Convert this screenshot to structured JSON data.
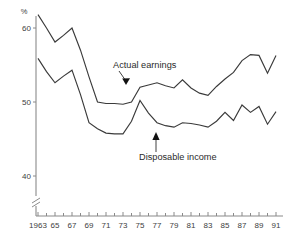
{
  "chart_data": {
    "type": "line",
    "title": "",
    "subtitle": "",
    "xlabel": "",
    "ylabel": "%",
    "unit_label": "%",
    "grid": false,
    "legend_position": "inline-annotations",
    "xlim": [
      1962.5,
      1991.5
    ],
    "ylim": [
      36.5,
      62.5
    ],
    "y_axis_break": true,
    "y_ticks": [
      60,
      50,
      40
    ],
    "y_tick_labels": [
      "60",
      "50",
      "40"
    ],
    "x_ticks": [
      1963,
      1965,
      1967,
      1969,
      1971,
      1973,
      1975,
      1977,
      1979,
      1981,
      1983,
      1985,
      1987,
      1989,
      1991
    ],
    "x_tick_labels": [
      "1963",
      "65",
      "67",
      "69",
      "71",
      "73",
      "75",
      "77",
      "79",
      "81",
      "83",
      "85",
      "87",
      "89",
      "91"
    ],
    "x": [
      1963,
      1964,
      1965,
      1966,
      1967,
      1968,
      1969,
      1970,
      1971,
      1972,
      1973,
      1974,
      1975,
      1976,
      1977,
      1978,
      1979,
      1980,
      1981,
      1982,
      1983,
      1984,
      1985,
      1986,
      1987,
      1988,
      1989,
      1990,
      1991
    ],
    "series": [
      {
        "name": "Actual earnings",
        "color": "#3a3a3a",
        "values": [
          61.8,
          60.0,
          58.1,
          59.0,
          60.0,
          57.0,
          53.4,
          50.0,
          49.8,
          49.8,
          49.7,
          50.0,
          52.0,
          52.3,
          52.6,
          52.2,
          51.9,
          53.0,
          51.9,
          51.2,
          50.9,
          52.1,
          53.1,
          54.0,
          55.6,
          56.4,
          56.3,
          53.9,
          56.3
        ]
      },
      {
        "name": "Disposable income",
        "color": "#3a3a3a",
        "values": [
          55.9,
          54.1,
          52.6,
          53.5,
          54.3,
          51.0,
          47.2,
          46.4,
          45.8,
          45.7,
          45.7,
          47.4,
          50.2,
          48.5,
          47.2,
          46.8,
          46.6,
          47.2,
          47.1,
          46.9,
          46.6,
          47.4,
          48.6,
          47.5,
          49.6,
          48.6,
          49.4,
          47.0,
          48.7
        ]
      }
    ],
    "annotations": [
      {
        "text": "Actual earnings",
        "target_year": 1974,
        "target_value": 52.0
      },
      {
        "text": "Disposable income",
        "target_year": 1977,
        "target_value": 47.2
      }
    ]
  }
}
